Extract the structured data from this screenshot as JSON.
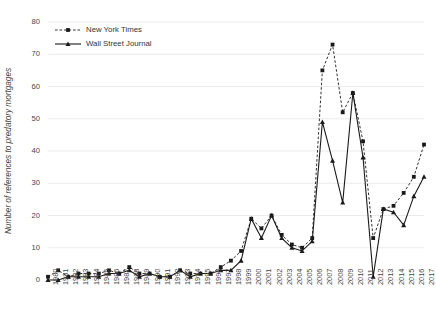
{
  "chart_data": {
    "type": "line",
    "title": "",
    "xlabel": "",
    "ylabel": "Number of references to predatory mortgages",
    "ylim": [
      0,
      80
    ],
    "ytick_step": 10,
    "grid": true,
    "legend_position": "top-left",
    "categories": [
      "1980",
      "1981",
      "1982",
      "1983",
      "1984",
      "1985",
      "1986",
      "1987",
      "1988",
      "1989",
      "1990",
      "1991",
      "1992",
      "1993",
      "1994",
      "1995",
      "1996",
      "1997",
      "1998",
      "1999",
      "2000",
      "2001",
      "2002",
      "2003",
      "2004",
      "2005",
      "2006",
      "2007",
      "2008",
      "2009",
      "2010",
      "2011",
      "2012",
      "2013",
      "2014",
      "2015",
      "2016",
      "2017"
    ],
    "yticks": [
      "0",
      "10",
      "20",
      "30",
      "40",
      "50",
      "60",
      "70",
      "80"
    ],
    "series": [
      {
        "name": "New York Times",
        "marker": "square",
        "line_style": "dashed",
        "color": "#1a1a1a",
        "values": [
          1,
          3,
          1,
          2,
          2,
          2,
          3,
          2,
          4,
          2,
          2,
          1,
          1,
          3,
          2,
          2,
          2,
          4,
          6,
          9,
          19,
          16,
          20,
          14,
          11,
          10,
          13,
          65,
          73,
          52,
          58,
          43,
          13,
          22,
          23,
          27,
          32,
          42
        ]
      },
      {
        "name": "Wall Street Journal",
        "marker": "triangle",
        "line_style": "solid",
        "color": "#1a1a1a",
        "values": [
          0,
          0,
          1,
          1,
          1,
          1,
          2,
          2,
          3,
          1,
          2,
          1,
          1,
          3,
          1,
          2,
          2,
          3,
          3,
          6,
          19,
          13,
          20,
          13,
          10,
          9,
          12,
          49,
          37,
          24,
          58,
          38,
          1,
          22,
          21,
          17,
          26,
          32
        ]
      }
    ]
  },
  "legend": {
    "items": [
      {
        "label": "New York Times"
      },
      {
        "label": "Wall Street Journal"
      }
    ]
  }
}
